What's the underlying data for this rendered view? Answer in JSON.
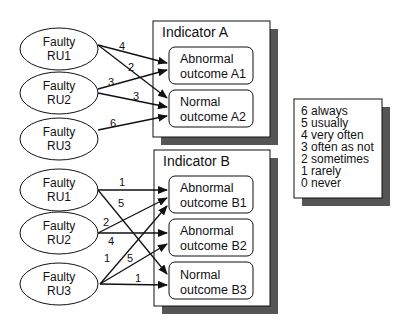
{
  "indicator_a": {
    "title": "Indicator A",
    "outcomes": [
      {
        "line1": "Abnormal",
        "line2": "outcome A1"
      },
      {
        "line1": "Normal",
        "line2": "outcome A2"
      }
    ],
    "sources": [
      {
        "line1": "Faulty",
        "line2": "RU1"
      },
      {
        "line1": "Faulty",
        "line2": "RU2"
      },
      {
        "line1": "Faulty",
        "line2": "RU3"
      }
    ],
    "edges": [
      {
        "from": "RU1",
        "to": "A1",
        "weight": "4"
      },
      {
        "from": "RU1",
        "to": "A2",
        "weight": "2"
      },
      {
        "from": "RU2",
        "to": "A1",
        "weight": "3"
      },
      {
        "from": "RU2",
        "to": "A2",
        "weight": "3"
      },
      {
        "from": "RU3",
        "to": "A2",
        "weight": "6"
      }
    ]
  },
  "indicator_b": {
    "title": "Indicator B",
    "outcomes": [
      {
        "line1": "Abnormal",
        "line2": "outcome B1"
      },
      {
        "line1": "Abnormal",
        "line2": "outcome B2"
      },
      {
        "line1": "Normal",
        "line2": "outcome B3"
      }
    ],
    "sources": [
      {
        "line1": "Faulty",
        "line2": "RU1"
      },
      {
        "line1": "Faulty",
        "line2": "RU2"
      },
      {
        "line1": "Faulty",
        "line2": "RU3"
      }
    ],
    "edges": [
      {
        "from": "RU1",
        "to": "B1",
        "weight": "1"
      },
      {
        "from": "RU1",
        "to": "B3",
        "weight": "5"
      },
      {
        "from": "RU2",
        "to": "B1",
        "weight": "2"
      },
      {
        "from": "RU2",
        "to": "B2",
        "weight": "4"
      },
      {
        "from": "RU3",
        "to": "B1",
        "weight": "1"
      },
      {
        "from": "RU3",
        "to": "B2",
        "weight": "5"
      },
      {
        "from": "RU3",
        "to": "B3",
        "weight": "1"
      }
    ]
  },
  "legend": {
    "items": [
      "6 always",
      "5 usually",
      "4 very often",
      "3 often as not",
      "2 sometimes",
      "1 rarely",
      "0 never"
    ]
  },
  "colors": {
    "shadow": "#555555",
    "stroke": "#111111",
    "fill": "#ffffff"
  }
}
